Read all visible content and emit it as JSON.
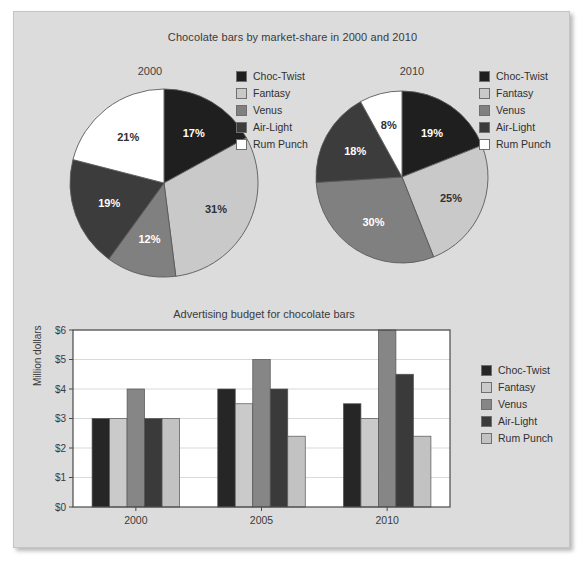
{
  "figure": {
    "background": "#dcdcdc",
    "page_background": "#ffffff"
  },
  "pies": {
    "title": "Chocolate bars by market-share in 2000 and 2010",
    "legend_items": [
      {
        "label": "Choc-Twist",
        "color": "#1f1f1f"
      },
      {
        "label": "Fantasy",
        "color": "#c9c9c9"
      },
      {
        "label": "Venus",
        "color": "#808080"
      },
      {
        "label": "Air-Light",
        "color": "#3c3c3c"
      },
      {
        "label": "Rum Punch",
        "color": "#ffffff"
      }
    ]
  },
  "bars": {
    "title": "Advertising budget for chocolate bars",
    "ylabel": "Million dollars",
    "legend_items": [
      {
        "label": "Choc-Twist",
        "color": "#262626"
      },
      {
        "label": "Fantasy",
        "color": "#cacaca"
      },
      {
        "label": "Venus",
        "color": "#868686"
      },
      {
        "label": "Air-Light",
        "color": "#3a3a3a"
      },
      {
        "label": "Rum Punch",
        "color": "#c2c2c2"
      }
    ]
  },
  "chart_data": [
    {
      "type": "pie",
      "title": "2000",
      "labels": [
        "Choc-Twist",
        "Fantasy",
        "Venus",
        "Air-Light",
        "Rum Punch"
      ],
      "values": [
        17,
        31,
        12,
        19,
        21
      ],
      "value_labels": [
        "17%",
        "31%",
        "12%",
        "19%",
        "21%"
      ],
      "colors": [
        "#1f1f1f",
        "#c9c9c9",
        "#808080",
        "#3c3c3c",
        "#ffffff"
      ],
      "label_colors": [
        "#ffffff",
        "#303030",
        "#ffffff",
        "#ffffff",
        "#303030"
      ],
      "start_angle_deg": 0,
      "direction": "clockwise",
      "legend_position": "right"
    },
    {
      "type": "pie",
      "title": "2010",
      "labels": [
        "Choc-Twist",
        "Fantasy",
        "Venus",
        "Air-Light",
        "Rum Punch"
      ],
      "values": [
        19,
        25,
        30,
        18,
        8
      ],
      "value_labels": [
        "19%",
        "25%",
        "30%",
        "18%",
        "8%"
      ],
      "colors": [
        "#1f1f1f",
        "#c9c9c9",
        "#808080",
        "#3c3c3c",
        "#ffffff"
      ],
      "label_colors": [
        "#ffffff",
        "#303030",
        "#ffffff",
        "#ffffff",
        "#303030"
      ],
      "start_angle_deg": 0,
      "direction": "clockwise",
      "legend_position": "right"
    },
    {
      "type": "bar",
      "title": "Advertising budget for chocolate bars",
      "xlabel": "",
      "ylabel": "Million dollars",
      "categories": [
        "2000",
        "2005",
        "2010"
      ],
      "ytick_labels": [
        "$0",
        "$1",
        "$2",
        "$3",
        "$4",
        "$5",
        "$6"
      ],
      "ytick_values": [
        0,
        1,
        2,
        3,
        4,
        5,
        6
      ],
      "ylim": [
        0,
        6
      ],
      "grid": true,
      "legend_position": "right",
      "series": [
        {
          "name": "Choc-Twist",
          "color": "#262626",
          "values": [
            3.0,
            4.0,
            3.5
          ]
        },
        {
          "name": "Fantasy",
          "color": "#cacaca",
          "values": [
            3.0,
            3.5,
            3.0
          ]
        },
        {
          "name": "Venus",
          "color": "#868686",
          "values": [
            4.0,
            5.0,
            6.0
          ]
        },
        {
          "name": "Air-Light",
          "color": "#3a3a3a",
          "values": [
            3.0,
            4.0,
            4.5
          ]
        },
        {
          "name": "Rum Punch",
          "color": "#c2c2c2",
          "values": [
            3.0,
            2.4,
            2.4
          ]
        }
      ]
    }
  ]
}
